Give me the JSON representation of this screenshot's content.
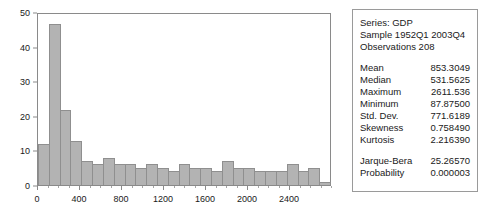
{
  "chart_data": {
    "type": "bar",
    "title": "",
    "xlabel": "",
    "ylabel": "",
    "ylim": [
      0,
      50
    ],
    "yticks": [
      0,
      10,
      20,
      30,
      40,
      50
    ],
    "xlim": [
      0,
      2800
    ],
    "xticks": [
      0,
      400,
      800,
      1200,
      1600,
      2000,
      2400
    ],
    "grid": false,
    "legend": "none",
    "bin_width": 100,
    "bin_starts": [
      0,
      100,
      200,
      300,
      400,
      500,
      600,
      700,
      800,
      900,
      1000,
      1100,
      1200,
      1300,
      1400,
      1500,
      1600,
      1700,
      1800,
      1900,
      2000,
      2100,
      2200,
      2300,
      2400,
      2500,
      2600
    ],
    "categories": [
      "0-100",
      "100-200",
      "200-300",
      "300-400",
      "400-500",
      "500-600",
      "600-700",
      "700-800",
      "800-900",
      "900-1000",
      "1000-1100",
      "1100-1200",
      "1200-1300",
      "1300-1400",
      "1400-1500",
      "1500-1600",
      "1600-1700",
      "1700-1800",
      "1800-1900",
      "1900-2000",
      "2000-2100",
      "2100-2200",
      "2200-2300",
      "2300-2400",
      "2400-2500",
      "2500-2600",
      "2600-2700"
    ],
    "values": [
      12,
      47,
      22,
      13,
      7,
      6,
      8,
      6,
      6,
      5,
      6,
      5,
      4,
      6,
      5,
      5,
      4,
      7,
      5,
      5,
      4,
      4,
      4,
      6,
      4,
      5,
      1
    ]
  },
  "stats": {
    "header": [
      {
        "label": "Series: GDP",
        "value": ""
      },
      {
        "label": "Sample 1952Q1 2003Q4",
        "value": ""
      },
      {
        "label": "Observations 208",
        "value": ""
      }
    ],
    "moments": [
      {
        "label": "Mean",
        "value": "853.3049"
      },
      {
        "label": "Median",
        "value": "531.5625"
      },
      {
        "label": "Maximum",
        "value": "2611.536"
      },
      {
        "label": "Minimum",
        "value": "87.87500"
      },
      {
        "label": "Std. Dev.",
        "value": "771.6189"
      },
      {
        "label": "Skewness",
        "value": "0.758490"
      },
      {
        "label": "Kurtosis",
        "value": "2.216390"
      }
    ],
    "tests": [
      {
        "label": "Jarque-Bera",
        "value": "25.26570"
      },
      {
        "label": "Probability",
        "value": "0.000003"
      }
    ]
  },
  "colors": {
    "bar_fill": "#b3b3b3",
    "bar_edge": "#8f8f8f",
    "axis": "#8a8a8a",
    "text": "#1a1a1a",
    "panel_border": "#9a9a9a",
    "background": "#ffffff"
  }
}
